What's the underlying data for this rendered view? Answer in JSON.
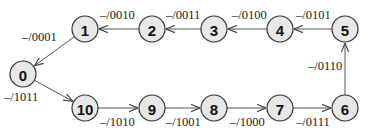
{
  "diagram": {
    "type": "state-transition-cycle",
    "nodes": [
      {
        "id": "0",
        "label": "0",
        "x": 23,
        "y": 74
      },
      {
        "id": "1",
        "label": "1",
        "x": 85,
        "y": 29
      },
      {
        "id": "2",
        "label": "2",
        "x": 152,
        "y": 29
      },
      {
        "id": "3",
        "label": "3",
        "x": 214,
        "y": 29
      },
      {
        "id": "4",
        "label": "4",
        "x": 280,
        "y": 29
      },
      {
        "id": "5",
        "label": "5",
        "x": 345,
        "y": 29
      },
      {
        "id": "6",
        "label": "6",
        "x": 345,
        "y": 108
      },
      {
        "id": "7",
        "label": "7",
        "x": 280,
        "y": 108
      },
      {
        "id": "8",
        "label": "8",
        "x": 214,
        "y": 108
      },
      {
        "id": "9",
        "label": "9",
        "x": 152,
        "y": 108
      },
      {
        "id": "10",
        "label": "10",
        "x": 85,
        "y": 108
      }
    ],
    "edges": [
      {
        "from": "0",
        "to": "10",
        "label": "–/1011",
        "lx": 4,
        "ly": 101
      },
      {
        "from": "10",
        "to": "9",
        "label": "–/1010",
        "lx": 100,
        "ly": 126
      },
      {
        "from": "9",
        "to": "8",
        "label": "–/1001",
        "lx": 166,
        "ly": 126
      },
      {
        "from": "8",
        "to": "7",
        "label": "–/1000",
        "lx": 230,
        "ly": 126
      },
      {
        "from": "7",
        "to": "6",
        "label": "–/0111",
        "lx": 296,
        "ly": 126
      },
      {
        "from": "6",
        "to": "5",
        "label": "–/0110",
        "lx": 308,
        "ly": 70
      },
      {
        "from": "5",
        "to": "4",
        "label": "–/0101",
        "lx": 296,
        "ly": 19
      },
      {
        "from": "4",
        "to": "3",
        "label": "–/0100",
        "lx": 232,
        "ly": 19
      },
      {
        "from": "3",
        "to": "2",
        "label": "–/0011",
        "lx": 166,
        "ly": 19
      },
      {
        "from": "2",
        "to": "1",
        "label": "–/0010",
        "lx": 100,
        "ly": 19
      },
      {
        "from": "1",
        "to": "0",
        "label": "–/0001",
        "lx": 22,
        "ly": 41
      }
    ]
  }
}
